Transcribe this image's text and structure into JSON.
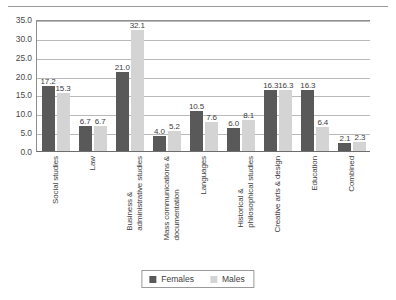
{
  "chart_data": {
    "type": "bar",
    "title": "",
    "subtitle": "",
    "xlabel": "",
    "ylabel": "",
    "ylim": [
      0.0,
      35.0
    ],
    "ytick_step": 5.0,
    "yticks": [
      "35.0",
      "30.0",
      "25.0",
      "20.0",
      "15.0",
      "10.0",
      "5.0",
      "0.0"
    ],
    "grid": true,
    "legend_position": "bottom-center",
    "value_labels": true,
    "categories": [
      "Social studies",
      "Law",
      "Business & administrative studies",
      "Mass communications & documentation",
      "Languages",
      "Historical & philosophical studies",
      "Creative arts & design",
      "Education",
      "Combined"
    ],
    "category_lines": [
      [
        "Social studies"
      ],
      [
        "Law"
      ],
      [
        "Business &",
        "administrative studies"
      ],
      [
        "Mass communications &",
        "documentation"
      ],
      [
        "Languages"
      ],
      [
        "Historical &",
        "philosophical studies"
      ],
      [
        "Creative arts & design"
      ],
      [
        "Education"
      ],
      [
        "Combined"
      ]
    ],
    "series": [
      {
        "name": "Females",
        "color": "#595959",
        "values": [
          17.2,
          6.7,
          21.0,
          4.0,
          10.5,
          6.0,
          16.3,
          16.3,
          2.1
        ],
        "labels": [
          "17.2",
          "6.7",
          "21.0",
          "4.0",
          "10.5",
          "6.0",
          "16.3",
          "16.3",
          "2.1"
        ]
      },
      {
        "name": "Males",
        "color": "#d4d4d4",
        "values": [
          15.3,
          6.7,
          32.1,
          5.2,
          7.6,
          8.1,
          16.3,
          6.4,
          2.3
        ],
        "labels": [
          "15.3",
          "6.7",
          "32.1",
          "5.2",
          "7.6",
          "8.1",
          "16.3",
          "6.4",
          "2.3"
        ]
      }
    ]
  },
  "legend": {
    "items": [
      {
        "label": "Females",
        "color": "#595959"
      },
      {
        "label": "Males",
        "color": "#d4d4d4"
      }
    ]
  }
}
